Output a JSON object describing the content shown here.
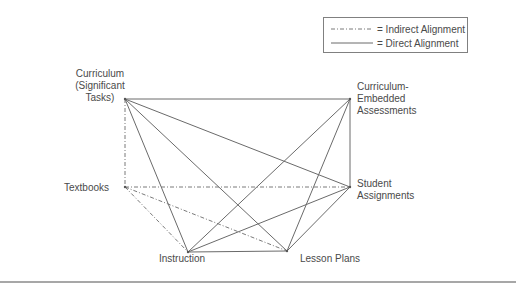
{
  "legend": {
    "items": [
      {
        "style": "indirect",
        "label": "= Indirect Alignment"
      },
      {
        "style": "direct",
        "label": "= Direct Alignment"
      }
    ]
  },
  "nodes": [
    {
      "id": "curriculum",
      "lines": [
        "Curriculum",
        "(Significant",
        "Tasks)"
      ]
    },
    {
      "id": "cea",
      "lines": [
        "Curriculum-",
        "Embedded",
        "Assessments"
      ]
    },
    {
      "id": "textbooks",
      "lines": [
        "Textbooks"
      ]
    },
    {
      "id": "student_assignments",
      "lines": [
        "Student",
        "Assignments"
      ]
    },
    {
      "id": "instruction",
      "lines": [
        "Instruction"
      ]
    },
    {
      "id": "lesson_plans",
      "lines": [
        "Lesson Plans"
      ]
    }
  ],
  "edges": [
    {
      "from": "curriculum",
      "to": "cea",
      "type": "direct"
    },
    {
      "from": "curriculum",
      "to": "student_assignments",
      "type": "direct"
    },
    {
      "from": "curriculum",
      "to": "instruction",
      "type": "direct"
    },
    {
      "from": "curriculum",
      "to": "lesson_plans",
      "type": "direct"
    },
    {
      "from": "cea",
      "to": "student_assignments",
      "type": "direct"
    },
    {
      "from": "cea",
      "to": "instruction",
      "type": "direct"
    },
    {
      "from": "cea",
      "to": "lesson_plans",
      "type": "direct"
    },
    {
      "from": "student_assignments",
      "to": "instruction",
      "type": "direct"
    },
    {
      "from": "student_assignments",
      "to": "lesson_plans",
      "type": "direct"
    },
    {
      "from": "instruction",
      "to": "lesson_plans",
      "type": "direct"
    },
    {
      "from": "curriculum",
      "to": "textbooks",
      "type": "indirect"
    },
    {
      "from": "textbooks",
      "to": "student_assignments",
      "type": "indirect"
    },
    {
      "from": "textbooks",
      "to": "instruction",
      "type": "indirect"
    },
    {
      "from": "textbooks",
      "to": "lesson_plans",
      "type": "indirect"
    }
  ]
}
